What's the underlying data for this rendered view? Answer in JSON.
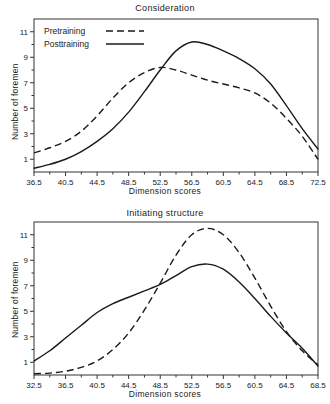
{
  "figure": {
    "background": "#ffffff",
    "ink_color": "#1a1a1a"
  },
  "chart_data": [
    {
      "type": "line",
      "title": "Consideration",
      "xlabel": "Dimension scores",
      "ylabel": "Number of foremen",
      "xlim": [
        36.5,
        72.5
      ],
      "ylim": [
        0,
        12
      ],
      "xticks": [
        "36.5",
        "40.5",
        "44.5",
        "48.5",
        "52.5",
        "56.5",
        "60.5",
        "64.5",
        "68.5",
        "72.5"
      ],
      "xtick_values": [
        36.5,
        40.5,
        44.5,
        48.5,
        52.5,
        56.5,
        60.5,
        64.5,
        68.5,
        72.5
      ],
      "yticks": [
        "1",
        "3",
        "5",
        "7",
        "9",
        "11"
      ],
      "ytick_values": [
        1,
        3,
        5,
        7,
        9,
        11
      ],
      "grid": false,
      "legend_position": "top-left",
      "legend": [
        {
          "name": "Pretraining",
          "style": "dashed"
        },
        {
          "name": "Posttraining",
          "style": "solid"
        }
      ],
      "x": [
        36.5,
        38.5,
        40.5,
        42.5,
        44.5,
        46.5,
        48.5,
        50.5,
        52.5,
        54.5,
        56.5,
        58.5,
        60.5,
        62.5,
        64.5,
        66.5,
        68.5,
        70.5,
        72.5
      ],
      "series": [
        {
          "name": "Pretraining",
          "style": "dashed",
          "values": [
            1.5,
            1.9,
            2.4,
            3.2,
            4.4,
            5.8,
            7.0,
            7.8,
            8.2,
            8.0,
            7.6,
            7.2,
            6.9,
            6.6,
            6.2,
            5.4,
            4.2,
            2.8,
            1.0
          ]
        },
        {
          "name": "Posttraining",
          "style": "solid",
          "values": [
            0.3,
            0.6,
            1.0,
            1.6,
            2.4,
            3.4,
            4.7,
            6.3,
            8.0,
            9.5,
            10.2,
            10.0,
            9.5,
            8.9,
            8.1,
            6.9,
            5.2,
            3.4,
            1.8
          ]
        }
      ]
    },
    {
      "type": "line",
      "title": "Initiating structure",
      "xlabel": "Dimension scores",
      "ylabel": "Number of foremen",
      "xlim": [
        32.5,
        68.5
      ],
      "ylim": [
        0,
        12
      ],
      "xticks": [
        "32.5",
        "36.5",
        "40.5",
        "44.5",
        "48.5",
        "52.5",
        "56.5",
        "60.5",
        "64.5",
        "68.5"
      ],
      "xtick_values": [
        32.5,
        36.5,
        40.5,
        44.5,
        48.5,
        52.5,
        56.5,
        60.5,
        64.5,
        68.5
      ],
      "yticks": [
        "1",
        "3",
        "5",
        "7",
        "9",
        "11"
      ],
      "ytick_values": [
        1,
        3,
        5,
        7,
        9,
        11
      ],
      "grid": false,
      "legend_position": "none",
      "legend": [
        {
          "name": "Pretraining",
          "style": "dashed"
        },
        {
          "name": "Posttraining",
          "style": "solid"
        }
      ],
      "x": [
        32.5,
        34.5,
        36.5,
        38.5,
        40.5,
        42.5,
        44.5,
        46.5,
        48.5,
        50.5,
        52.5,
        54.5,
        56.5,
        58.5,
        60.5,
        62.5,
        64.5,
        66.5,
        68.5
      ],
      "series": [
        {
          "name": "Pretraining",
          "style": "dashed",
          "values": [
            0.1,
            0.15,
            0.3,
            0.6,
            1.1,
            2.0,
            3.3,
            5.1,
            7.2,
            9.4,
            11.0,
            11.5,
            11.0,
            9.6,
            7.6,
            5.4,
            3.4,
            1.9,
            0.8
          ]
        },
        {
          "name": "Posttraining",
          "style": "solid",
          "values": [
            1.1,
            1.9,
            2.9,
            3.9,
            4.9,
            5.6,
            6.1,
            6.6,
            7.1,
            7.8,
            8.5,
            8.7,
            8.3,
            7.3,
            6.0,
            4.6,
            3.3,
            2.1,
            0.7
          ]
        }
      ]
    }
  ]
}
